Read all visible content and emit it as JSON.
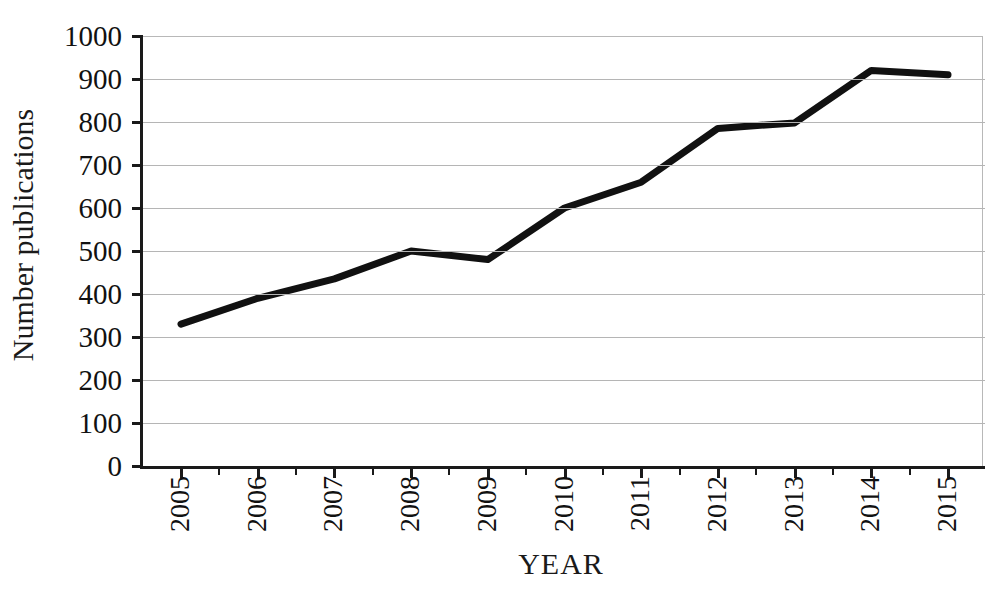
{
  "chart_data": {
    "type": "line",
    "title": "",
    "xlabel": "YEAR",
    "ylabel": "Number publications",
    "categories": [
      "2005",
      "2006",
      "2007",
      "2008",
      "2009",
      "2010",
      "2011",
      "2012",
      "2013",
      "2014",
      "2015"
    ],
    "values": [
      330,
      390,
      435,
      500,
      480,
      600,
      660,
      785,
      798,
      920,
      910
    ],
    "series": [
      {
        "name": "Number publications",
        "values": [
          330,
          390,
          435,
          500,
          480,
          600,
          660,
          785,
          798,
          920,
          910
        ]
      }
    ],
    "ylim": [
      0,
      1000
    ],
    "ytick_labels": [
      "1000",
      "900",
      "800",
      "700",
      "600",
      "500",
      "400",
      "300",
      "200",
      "100",
      "0"
    ],
    "ytick_values": [
      1000,
      900,
      800,
      700,
      600,
      500,
      400,
      300,
      200,
      100,
      0
    ],
    "grid": "horizontal",
    "legend": "none",
    "line_color": "#111111",
    "grid_color": "#b5b5b5",
    "axis_color": "#1a1a1a",
    "background_color": "#ffffff"
  }
}
